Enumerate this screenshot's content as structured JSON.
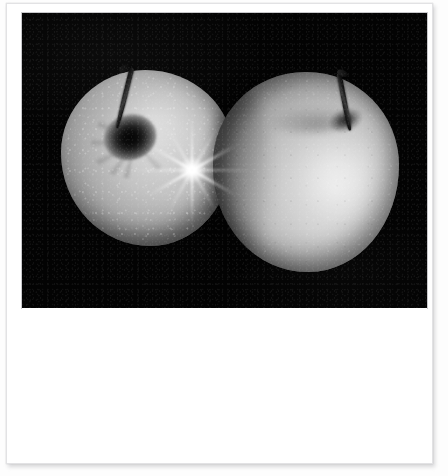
{
  "document": {
    "kind": "photograph-print",
    "style": "polaroid-card",
    "caption": "",
    "canvas": {
      "width_px": 448,
      "height_px": 476,
      "background_color": "#fdfdfd"
    }
  },
  "card": {
    "name": "photo-card",
    "background_color": "#ffffff",
    "border_color": "#e2e2e4",
    "x_px": 6,
    "y_px": 3,
    "width_px": 427,
    "height_px": 461
  },
  "photo": {
    "title": "Two apples on a black background",
    "medium": "black-and-white photograph",
    "background_color": "#000000",
    "x_px": 21,
    "y_px": 12,
    "width_px": 405,
    "height_px": 295,
    "subjects": [
      {
        "name": "apple-left",
        "label": "Left apple",
        "center_x_px": 140,
        "center_y_px": 154,
        "width_px": 172,
        "height_px": 176,
        "tone_highlight": "#d6d6d6",
        "tone_shadow": "#1b1b1b",
        "features": [
          "dark stem angled up and to the left",
          "deep shadowed calyx well with radial creases",
          "pale lenticel speckles over the skin",
          "six-point lens starburst flare at the right shoulder"
        ]
      },
      {
        "name": "apple-right",
        "label": "Right apple",
        "center_x_px": 305,
        "center_y_px": 180,
        "width_px": 186,
        "height_px": 200,
        "tone_highlight": "#e6e6e6",
        "tone_shadow": "#0a0a0a",
        "features": [
          "dark stem angled up and to the right",
          "shallow stem well near the top-right shoulder",
          "broad soft specular highlight on the right flank",
          "shadowed left flank where it overlaps the left apple"
        ]
      }
    ],
    "lens_flare": {
      "name": "star-flare",
      "center_x_px": 170,
      "center_y_px": 157,
      "points": 6,
      "color": "#ffffff"
    }
  },
  "caption_area": {
    "name": "caption-area",
    "text": "",
    "background_color": "#ffffff",
    "x_px": 21,
    "y_px": 307,
    "width_px": 405,
    "height_px": 152
  }
}
